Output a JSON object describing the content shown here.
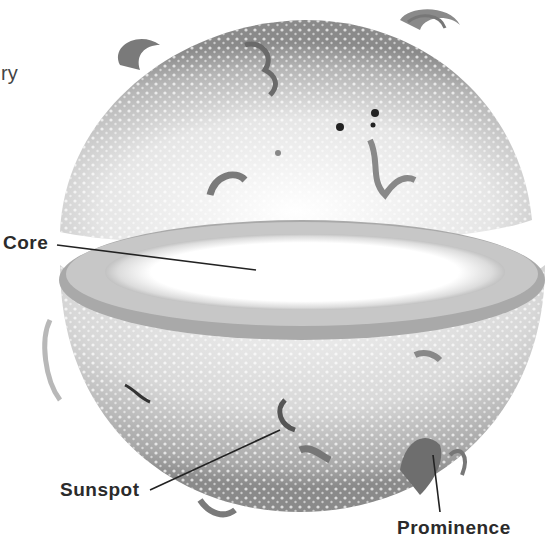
{
  "figure": {
    "partial_text": "ry",
    "labels": [
      {
        "id": "core",
        "text": "Core"
      },
      {
        "id": "sunspot",
        "text": "Sunspot"
      },
      {
        "id": "prominence",
        "text": "Prominence"
      }
    ],
    "colors": {
      "surface": "#c9c9c9",
      "surface_dark": "#8f8f8f",
      "core": "#ffffff",
      "ink": "#2b2b2b"
    }
  }
}
